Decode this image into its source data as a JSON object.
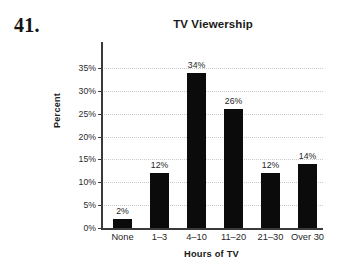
{
  "figure": {
    "number_label": "41."
  },
  "chart_data": {
    "type": "bar",
    "title": "TV Viewership",
    "xlabel": "Hours of TV",
    "ylabel": "Percent",
    "categories": [
      "None",
      "1–3",
      "4–10",
      "11–20",
      "21–30",
      "Over 30"
    ],
    "values": [
      2,
      12,
      34,
      26,
      12,
      14
    ],
    "data_labels": [
      "2%",
      "12%",
      "34%",
      "26%",
      "12%",
      "14%"
    ],
    "ylim": [
      0,
      35
    ],
    "ytick_values": [
      0,
      5,
      10,
      15,
      20,
      25,
      30,
      35
    ],
    "ytick_labels": [
      "0%",
      "5%",
      "10%",
      "15%",
      "20%",
      "25%",
      "30%",
      "35%"
    ],
    "grid": "horizontal-dotted",
    "legend": null,
    "bar_color": "#0b0b0b",
    "grid_color": "#c9c9c9",
    "axis_color": "#3a3a3a",
    "background": "#ffffff"
  }
}
